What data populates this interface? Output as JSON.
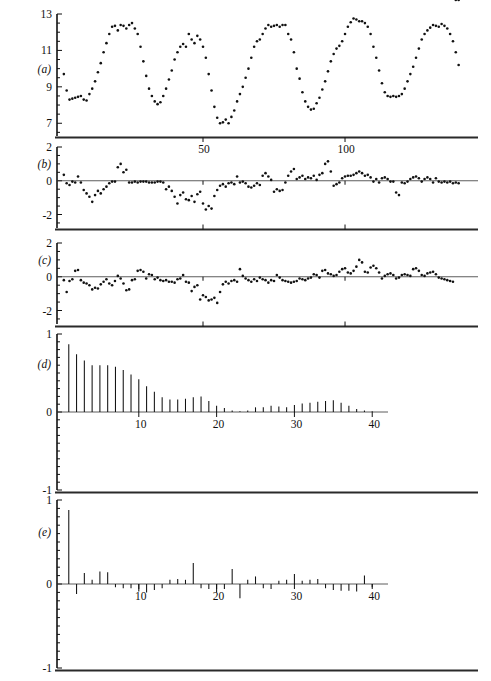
{
  "figure": {
    "background_color": "#ffffff",
    "ink_color": "#111111",
    "caption": "",
    "panel_labels": {
      "a": "(a)",
      "b": "(b)",
      "c": "(c)",
      "d": "(d)",
      "e": "(e)"
    }
  },
  "chart_data": [
    {
      "id": "a",
      "type": "scatter",
      "title": "",
      "panel_label": "(a)",
      "xlabel": "",
      "ylabel": "",
      "grid": false,
      "legend": null,
      "xlim": [
        0,
        144
      ],
      "ylim": [
        6.3,
        13
      ],
      "ytick_values": [
        13,
        11,
        9,
        7
      ],
      "ytick_labels": [
        "13",
        "11",
        "9",
        "7"
      ],
      "xtick_values": [
        50,
        100
      ],
      "xtick_labels": [
        "50",
        "100"
      ],
      "x": [
        1,
        2,
        3,
        4,
        5,
        6,
        7,
        8,
        9,
        10,
        11,
        12,
        13,
        14,
        15,
        16,
        17,
        18,
        19,
        20,
        21,
        22,
        23,
        24,
        25,
        26,
        27,
        28,
        29,
        30,
        31,
        32,
        33,
        34,
        35,
        36,
        37,
        38,
        39,
        40,
        41,
        42,
        43,
        44,
        45,
        46,
        47,
        48,
        49,
        50,
        51,
        52,
        53,
        54,
        55,
        56,
        57,
        58,
        59,
        60,
        61,
        62,
        63,
        64,
        65,
        66,
        67,
        68,
        69,
        70,
        71,
        72,
        73,
        74,
        75,
        76,
        77,
        78,
        79,
        80,
        81,
        82,
        83,
        84,
        85,
        86,
        87,
        88,
        89,
        90,
        91,
        92,
        93,
        94,
        95,
        96,
        97,
        98,
        99,
        100,
        101,
        102,
        103,
        104,
        105,
        106,
        107,
        108,
        109,
        110,
        111,
        112,
        113,
        114,
        115,
        116,
        117,
        118,
        119,
        120,
        121,
        122,
        123,
        124,
        125,
        126,
        127,
        128,
        129,
        130,
        131,
        132,
        133,
        134,
        135,
        136,
        137,
        138,
        139,
        140
      ],
      "values": [
        9.7,
        8.8,
        8.3,
        8.35,
        8.4,
        8.45,
        8.5,
        8.3,
        8.25,
        8.6,
        8.9,
        9.3,
        9.8,
        10.3,
        10.9,
        11.4,
        11.9,
        12.3,
        12.35,
        12.1,
        12.4,
        12.35,
        12.2,
        12.4,
        12.5,
        12.2,
        11.9,
        11.2,
        10.4,
        9.6,
        8.9,
        8.5,
        8.2,
        8.05,
        8.15,
        8.5,
        8.9,
        9.4,
        9.9,
        10.5,
        10.9,
        11.2,
        11.35,
        11.2,
        11.9,
        11.6,
        11.4,
        11.8,
        11.6,
        11.2,
        10.6,
        9.7,
        8.8,
        7.9,
        7.3,
        7.0,
        7.05,
        7.2,
        7.0,
        7.35,
        7.7,
        8.2,
        8.6,
        9.0,
        9.5,
        10.0,
        10.6,
        11.2,
        11.5,
        11.6,
        11.9,
        12.2,
        12.4,
        12.3,
        12.35,
        12.4,
        12.3,
        12.4,
        12.4,
        11.9,
        11.6,
        10.9,
        10.0,
        9.45,
        8.7,
        8.2,
        7.9,
        7.75,
        7.8,
        8.1,
        8.4,
        8.85,
        9.3,
        9.85,
        10.4,
        10.8,
        11.1,
        11.25,
        11.5,
        11.9,
        12.3,
        12.55,
        12.75,
        12.7,
        12.6,
        12.6,
        12.5,
        12.3,
        11.9,
        11.2,
        10.6,
        9.9,
        9.2,
        8.7,
        8.5,
        8.45,
        8.5,
        8.45,
        8.5,
        8.6,
        8.9,
        9.3,
        9.7,
        10.1,
        10.6,
        11.1,
        11.6,
        11.9,
        12.1,
        12.25,
        12.4,
        12.35,
        12.3,
        12.45,
        12.35,
        12.2,
        11.9,
        11.5,
        10.9,
        10.2,
        9.6,
        9.1
      ],
      "marker": "dot",
      "marker_size": 2.1
    },
    {
      "id": "b",
      "type": "scatter",
      "title": "",
      "panel_label": "(b)",
      "xlabel": "",
      "ylabel": "",
      "grid": false,
      "legend": null,
      "xlim": [
        0,
        144
      ],
      "ylim": [
        -2.8,
        2
      ],
      "ytick_values": [
        2,
        0,
        -2
      ],
      "ytick_labels": [
        "2",
        "0",
        "-2"
      ],
      "xtick_values": [
        50,
        100
      ],
      "xtick_labels": [
        "50",
        "100"
      ],
      "zero_line": 0,
      "x": [
        1,
        2,
        3,
        4,
        5,
        6,
        7,
        8,
        9,
        10,
        11,
        12,
        13,
        14,
        15,
        16,
        17,
        18,
        19,
        20,
        21,
        22,
        23,
        24,
        25,
        26,
        27,
        28,
        29,
        30,
        31,
        32,
        33,
        34,
        35,
        36,
        37,
        38,
        39,
        40,
        41,
        42,
        43,
        44,
        45,
        46,
        47,
        48,
        49,
        50,
        51,
        52,
        53,
        54,
        55,
        56,
        57,
        58,
        59,
        60,
        61,
        62,
        63,
        64,
        65,
        66,
        67,
        68,
        69,
        70,
        71,
        72,
        73,
        74,
        75,
        76,
        77,
        78,
        79,
        80,
        81,
        82,
        83,
        84,
        85,
        86,
        87,
        88,
        89,
        90,
        91,
        92,
        93,
        94,
        95,
        96,
        97,
        98,
        99,
        100,
        101,
        102,
        103,
        104,
        105,
        106,
        107,
        108,
        109,
        110,
        111,
        112,
        113,
        114,
        115,
        116,
        117,
        118,
        119,
        120,
        121,
        122,
        123,
        124,
        125,
        126,
        127,
        128,
        129,
        130,
        131,
        132,
        133,
        134,
        135,
        136,
        137,
        138,
        139,
        140
      ],
      "values": [
        0.35,
        -0.15,
        -0.25,
        -0.05,
        -0.1,
        0.25,
        -0.1,
        -0.55,
        -0.75,
        -0.95,
        -1.25,
        -0.85,
        -0.6,
        -0.75,
        -0.5,
        -0.35,
        -0.15,
        -0.05,
        -0.05,
        0.8,
        1.0,
        0.5,
        0.65,
        -0.1,
        -0.1,
        -0.05,
        -0.1,
        -0.05,
        -0.05,
        -0.05,
        -0.1,
        -0.1,
        -0.1,
        -0.05,
        -0.05,
        -0.1,
        -0.5,
        -0.35,
        -0.6,
        -0.95,
        -1.35,
        -0.85,
        -0.7,
        -1.1,
        -1.15,
        -0.9,
        -1.25,
        -0.8,
        -0.65,
        -1.35,
        -1.7,
        -1.5,
        -1.65,
        -0.9,
        -0.55,
        -0.3,
        -0.2,
        -0.35,
        -0.15,
        -0.1,
        -0.2,
        0.25,
        -0.1,
        -0.05,
        -0.15,
        -0.35,
        -0.4,
        -0.3,
        -0.15,
        -0.25,
        0.3,
        0.45,
        0.25,
        0.05,
        -0.65,
        -0.5,
        -0.6,
        -0.55,
        -0.1,
        0.3,
        0.55,
        0.7,
        0.1,
        0.2,
        0.3,
        0.1,
        0.2,
        0.15,
        0.3,
        0.05,
        0.35,
        0.45,
        1.0,
        1.15,
        0.55,
        -0.3,
        -0.2,
        -0.1,
        0.15,
        0.25,
        0.3,
        0.3,
        0.35,
        0.45,
        0.55,
        0.45,
        0.3,
        0.35,
        0.2,
        -0.05,
        0.1,
        -0.1,
        0.15,
        0.2,
        0.1,
        -0.05,
        -0.05,
        -0.7,
        -0.85,
        -0.1,
        -0.15,
        -0.05,
        0.1,
        0.2,
        0.25,
        0.15,
        -0.05,
        0.1,
        0.2,
        0.1,
        -0.1,
        0.15,
        -0.05,
        -0.1,
        -0.05,
        -0.1,
        -0.05,
        -0.15,
        -0.1,
        -0.15,
        -0.1
      ],
      "marker": "dot",
      "marker_size": 2.1
    },
    {
      "id": "c",
      "type": "scatter",
      "title": "",
      "panel_label": "(c)",
      "xlabel": "",
      "ylabel": "",
      "grid": false,
      "legend": null,
      "xlim": [
        0,
        144
      ],
      "ylim": [
        -2.8,
        2
      ],
      "ytick_values": [
        2,
        0,
        -2
      ],
      "ytick_labels": [
        "2",
        "0",
        "-2"
      ],
      "xtick_values": [
        50,
        100
      ],
      "xtick_labels": [
        "50",
        "100"
      ],
      "zero_line": 0,
      "x": [
        1,
        2,
        3,
        4,
        5,
        6,
        7,
        8,
        9,
        10,
        11,
        12,
        13,
        14,
        15,
        16,
        17,
        18,
        19,
        20,
        21,
        22,
        23,
        24,
        25,
        26,
        27,
        28,
        29,
        30,
        31,
        32,
        33,
        34,
        35,
        36,
        37,
        38,
        39,
        40,
        41,
        42,
        43,
        44,
        45,
        46,
        47,
        48,
        49,
        50,
        51,
        52,
        53,
        54,
        55,
        56,
        57,
        58,
        59,
        60,
        61,
        62,
        63,
        64,
        65,
        66,
        67,
        68,
        69,
        70,
        71,
        72,
        73,
        74,
        75,
        76,
        77,
        78,
        79,
        80,
        81,
        82,
        83,
        84,
        85,
        86,
        87,
        88,
        89,
        90,
        91,
        92,
        93,
        94,
        95,
        96,
        97,
        98,
        99,
        100,
        101,
        102,
        103,
        104,
        105,
        106,
        107,
        108,
        109,
        110,
        111,
        112,
        113,
        114,
        115,
        116,
        117,
        118,
        119,
        120,
        121,
        122,
        123,
        124,
        125,
        126,
        127,
        128,
        129,
        130,
        131,
        132,
        133,
        134,
        135,
        136,
        137,
        138,
        139,
        140
      ],
      "values": [
        -0.2,
        -0.9,
        -0.25,
        -0.15,
        0.35,
        0.4,
        -0.2,
        -0.35,
        -0.4,
        -0.5,
        -0.75,
        -0.65,
        -0.7,
        -0.45,
        -0.3,
        -0.15,
        -0.4,
        -0.5,
        -0.25,
        0.05,
        -0.1,
        -0.4,
        -0.8,
        -0.75,
        -0.2,
        -0.15,
        0.35,
        0.4,
        0.3,
        -0.1,
        0.15,
        0.1,
        -0.15,
        -0.05,
        -0.2,
        -0.25,
        -0.2,
        -0.3,
        -0.3,
        -0.35,
        -0.15,
        -0.1,
        0.1,
        -0.3,
        -0.35,
        -0.85,
        -0.6,
        -0.5,
        -1.35,
        -1.1,
        -1.2,
        -1.4,
        -1.35,
        -1.25,
        -1.55,
        -0.9,
        -0.45,
        -0.3,
        -0.4,
        -0.25,
        -0.2,
        -0.3,
        0.45,
        0.05,
        -0.1,
        -0.2,
        -0.3,
        -0.15,
        -0.25,
        -0.05,
        -0.15,
        -0.2,
        -0.35,
        -0.2,
        -0.25,
        0.1,
        -0.05,
        -0.2,
        -0.25,
        -0.3,
        -0.35,
        -0.3,
        -0.25,
        -0.1,
        -0.15,
        -0.2,
        -0.1,
        -0.05,
        0.15,
        0.1,
        -0.05,
        0.35,
        0.4,
        0.2,
        0.15,
        0.05,
        0.1,
        0.3,
        0.45,
        0.5,
        0.25,
        0.2,
        0.35,
        0.6,
        1.0,
        0.85,
        0.3,
        0.25,
        0.55,
        0.65,
        0.5,
        0.25,
        -0.1,
        0.05,
        0.15,
        0.2,
        0.1,
        -0.1,
        -0.05,
        0.1,
        0.15,
        0.1,
        0.05,
        0.45,
        0.5,
        0.35,
        0.1,
        0.05,
        0.2,
        0.25,
        0.3,
        0.15,
        -0.05,
        -0.1,
        -0.15,
        -0.2,
        -0.25,
        -0.3
      ],
      "marker": "dot",
      "marker_size": 2.1
    },
    {
      "id": "d",
      "type": "bar",
      "title": "",
      "panel_label": "(d)",
      "subtitle": "autocorrelation function",
      "xlabel": "",
      "ylabel": "",
      "grid": false,
      "legend": null,
      "xlim": [
        0,
        41
      ],
      "ylim": [
        -1,
        1
      ],
      "ytick_values": [
        1,
        0,
        -1
      ],
      "ytick_labels": [
        "1",
        "0",
        "-1"
      ],
      "xtick_values": [
        10,
        20,
        30,
        40
      ],
      "xtick_labels": [
        "10",
        "20",
        "30",
        "40"
      ],
      "zero_line": 0,
      "categories": [
        1,
        2,
        3,
        4,
        5,
        6,
        7,
        8,
        9,
        10,
        11,
        12,
        13,
        14,
        15,
        16,
        17,
        18,
        19,
        20,
        21,
        22,
        23,
        24,
        25,
        26,
        27,
        28,
        29,
        30,
        31,
        32,
        33,
        34,
        35,
        36,
        37,
        38,
        39,
        40
      ],
      "values": [
        0.87,
        0.74,
        0.66,
        0.6,
        0.6,
        0.6,
        0.58,
        0.54,
        0.48,
        0.42,
        0.33,
        0.26,
        0.19,
        0.16,
        0.16,
        0.17,
        0.19,
        0.2,
        0.14,
        0.08,
        0.05,
        0.02,
        0.01,
        0.02,
        0.06,
        0.06,
        0.08,
        0.07,
        0.06,
        0.09,
        0.11,
        0.12,
        0.13,
        0.14,
        0.15,
        0.12,
        0.08,
        0.04,
        0.02,
        0.01
      ]
    },
    {
      "id": "e",
      "type": "bar",
      "title": "",
      "panel_label": "(e)",
      "subtitle": "partial autocorrelation function",
      "xlabel": "",
      "ylabel": "",
      "grid": false,
      "legend": null,
      "xlim": [
        0,
        41
      ],
      "ylim": [
        -1,
        1
      ],
      "ytick_values": [
        1,
        0,
        -1
      ],
      "ytick_labels": [
        "1",
        "0",
        "-1"
      ],
      "xtick_values": [
        10,
        20,
        30,
        40
      ],
      "xtick_labels": [
        "10",
        "20",
        "30",
        "40"
      ],
      "zero_line": 0,
      "categories": [
        1,
        2,
        3,
        4,
        5,
        6,
        7,
        8,
        9,
        10,
        11,
        12,
        13,
        14,
        15,
        16,
        17,
        18,
        19,
        20,
        21,
        22,
        23,
        24,
        25,
        26,
        27,
        28,
        29,
        30,
        31,
        32,
        33,
        34,
        35,
        36,
        37,
        38,
        39,
        40
      ],
      "values": [
        0.88,
        -0.12,
        0.13,
        0.05,
        0.15,
        0.14,
        -0.04,
        -0.05,
        -0.05,
        -0.09,
        -0.1,
        -0.07,
        -0.05,
        0.05,
        0.06,
        0.05,
        0.25,
        -0.05,
        -0.06,
        -0.1,
        -0.06,
        0.18,
        -0.17,
        0.05,
        0.09,
        -0.05,
        -0.06,
        0.04,
        0.05,
        0.12,
        0.04,
        0.05,
        0.06,
        -0.05,
        -0.07,
        -0.08,
        -0.08,
        -0.09,
        0.1,
        -0.04
      ]
    }
  ]
}
